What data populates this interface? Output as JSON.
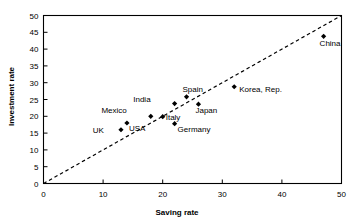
{
  "chart_data": {
    "type": "scatter",
    "title": "",
    "xlabel": "Saving rate",
    "ylabel": "Investment rate",
    "xlim": [
      0,
      50
    ],
    "ylim": [
      0,
      50
    ],
    "xticks": [
      0,
      10,
      20,
      30,
      40,
      50
    ],
    "yticks": [
      0,
      5,
      10,
      15,
      20,
      25,
      30,
      35,
      40,
      45,
      50
    ],
    "grid": false,
    "legend": "none",
    "marker": "filled-diamond",
    "marker_color": "#000000",
    "reference_line": {
      "name": "45-degree-line",
      "style": "dashed",
      "color": "#000000",
      "from": [
        0,
        0
      ],
      "to": [
        50,
        50
      ]
    },
    "points": [
      {
        "label": "UK",
        "x": 13,
        "y": 16,
        "label_dx": -17,
        "label_dy": 3
      },
      {
        "label": "USA",
        "x": 14,
        "y": 18,
        "label_dx": 2,
        "label_dy": 8
      },
      {
        "label": "Mexico",
        "x": 18,
        "y": 20,
        "label_dx": -24,
        "label_dy": -3
      },
      {
        "label": "Italy",
        "x": 20,
        "y": 19.9,
        "label_dx": 3,
        "label_dy": 3
      },
      {
        "label": "India",
        "x": 22,
        "y": 23.8,
        "label_dx": -24,
        "label_dy": -2
      },
      {
        "label": "Germany",
        "x": 22,
        "y": 17.8,
        "label_dx": 3,
        "label_dy": 8
      },
      {
        "label": "Spain",
        "x": 24,
        "y": 25.8,
        "label_dx": -4,
        "label_dy": -5
      },
      {
        "label": "Japan",
        "x": 26,
        "y": 23.6,
        "label_dx": -3,
        "label_dy": 9
      },
      {
        "label": "Korea, Rep.",
        "x": 32,
        "y": 28.8,
        "label_dx": 5,
        "label_dy": 5
      },
      {
        "label": "China",
        "x": 47,
        "y": 43.8,
        "label_dx": -4,
        "label_dy": 10
      }
    ]
  }
}
